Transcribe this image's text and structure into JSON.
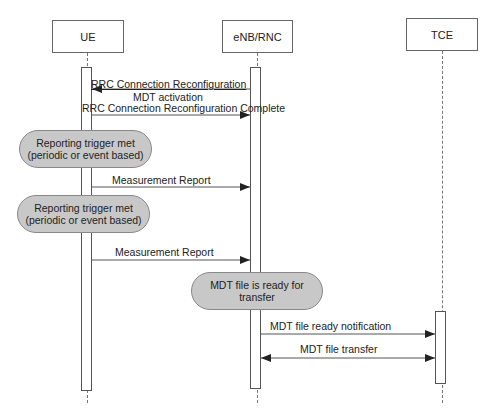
{
  "actors": [
    {
      "name": "UE"
    },
    {
      "name": "eNB/RNC"
    },
    {
      "name": "TCE"
    }
  ],
  "messages": [
    {
      "label": "RRC Connection Reconfiguration",
      "from": "eNB/RNC",
      "to": "UE"
    },
    {
      "label": "MDT activation",
      "from": "",
      "to": ""
    },
    {
      "label": "RRC Connection Reconfiguration Complete",
      "from": "UE",
      "to": "eNB/RNC"
    },
    {
      "label": "Measurement Report",
      "from": "UE",
      "to": "eNB/RNC"
    },
    {
      "label": "Measurement Report",
      "from": "UE",
      "to": "eNB/RNC"
    },
    {
      "label": "MDT file ready notification",
      "from": "eNB/RNC",
      "to": "TCE"
    },
    {
      "label": "MDT file transfer",
      "from": "eNB/RNC",
      "to": "TCE",
      "bidirectional": true
    }
  ],
  "notes": [
    {
      "line1": "Reporting trigger met",
      "line2": "(periodic or event based)"
    },
    {
      "line1": "Reporting trigger met",
      "line2": "(periodic or event based)"
    },
    {
      "line1": "MDT file is ready for",
      "line2": "transfer"
    }
  ],
  "colors": {
    "note_fill": "#c8c8c8",
    "line": "#555555"
  }
}
